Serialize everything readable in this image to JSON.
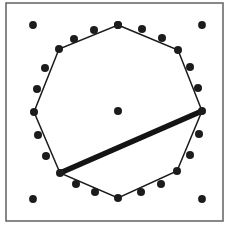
{
  "figure": {
    "canvas": {
      "width": 228,
      "height": 228,
      "background": "#ffffff"
    },
    "frame": {
      "label": "plot-frame",
      "x": 6,
      "y": 3,
      "width": 217,
      "height": 218,
      "stroke_color": "#6b6b6b",
      "stroke_width": 1.6
    },
    "colors": {
      "ink": "#1a1a1a",
      "dot": "#1c1c1c",
      "chord": "#141414",
      "frame": "#6b6b6b",
      "background": "#ffffff"
    },
    "polygon": {
      "label": "convex-hull-octagon",
      "sides": 8,
      "stroke_color": "#1a1a1a",
      "stroke_width": 1.5,
      "vertices": [
        {
          "name": "top",
          "x": 118,
          "y": 25
        },
        {
          "name": "upper-right",
          "x": 178,
          "y": 50
        },
        {
          "name": "right",
          "x": 202,
          "y": 111
        },
        {
          "name": "lower-right",
          "x": 177,
          "y": 171
        },
        {
          "name": "bottom",
          "x": 118,
          "y": 198
        },
        {
          "name": "lower-left",
          "x": 60,
          "y": 173
        },
        {
          "name": "left",
          "x": 34,
          "y": 112
        },
        {
          "name": "upper-left",
          "x": 59,
          "y": 49
        }
      ]
    },
    "chord": {
      "label": "thick-diagonal-chord",
      "from": {
        "name": "lower-left",
        "x": 60,
        "y": 173
      },
      "to": {
        "name": "right",
        "x": 202,
        "y": 111
      },
      "stroke_color": "#141414",
      "stroke_width": 5.4
    },
    "center_point": {
      "label": "center-dot",
      "x": 118,
      "y": 111,
      "radius": 4.0
    },
    "corner_points": {
      "label": "corner-dots",
      "radius": 3.9,
      "points": [
        {
          "name": "corner-top-left",
          "x": 33,
          "y": 25
        },
        {
          "name": "corner-top-right",
          "x": 202,
          "y": 25
        },
        {
          "name": "corner-bottom-left",
          "x": 33,
          "y": 199
        },
        {
          "name": "corner-bottom-right",
          "x": 202,
          "y": 199
        }
      ]
    },
    "ring_points": {
      "label": "ring-dots",
      "count": 17,
      "radius": 4.0,
      "points": [
        {
          "name": "ring-00",
          "x": 118,
          "y": 25
        },
        {
          "name": "ring-01",
          "x": 142,
          "y": 29
        },
        {
          "name": "ring-02",
          "x": 162,
          "y": 38
        },
        {
          "name": "ring-03",
          "x": 190,
          "y": 67
        },
        {
          "name": "ring-04",
          "x": 198,
          "y": 88
        },
        {
          "name": "ring-05",
          "x": 199,
          "y": 134
        },
        {
          "name": "ring-06",
          "x": 190,
          "y": 155
        },
        {
          "name": "ring-07",
          "x": 161,
          "y": 184
        },
        {
          "name": "ring-08",
          "x": 141,
          "y": 192
        },
        {
          "name": "ring-09",
          "x": 95,
          "y": 192
        },
        {
          "name": "ring-10",
          "x": 76,
          "y": 184
        },
        {
          "name": "ring-11",
          "x": 46,
          "y": 156
        },
        {
          "name": "ring-12",
          "x": 38,
          "y": 135
        },
        {
          "name": "ring-13",
          "x": 37,
          "y": 89
        },
        {
          "name": "ring-14",
          "x": 45,
          "y": 68
        },
        {
          "name": "ring-15",
          "x": 74,
          "y": 39
        },
        {
          "name": "ring-16",
          "x": 94,
          "y": 30
        }
      ]
    },
    "vertex_markers": {
      "label": "polygon-vertex-dots",
      "radius": 4.0,
      "points": [
        {
          "name": "vertex-top",
          "x": 118,
          "y": 25
        },
        {
          "name": "vertex-upper-right",
          "x": 178,
          "y": 50
        },
        {
          "name": "vertex-right",
          "x": 202,
          "y": 111
        },
        {
          "name": "vertex-lower-right",
          "x": 177,
          "y": 171
        },
        {
          "name": "vertex-bottom",
          "x": 118,
          "y": 198
        },
        {
          "name": "vertex-lower-left",
          "x": 60,
          "y": 173
        },
        {
          "name": "vertex-left",
          "x": 34,
          "y": 112
        },
        {
          "name": "vertex-upper-left",
          "x": 59,
          "y": 49
        }
      ]
    }
  }
}
